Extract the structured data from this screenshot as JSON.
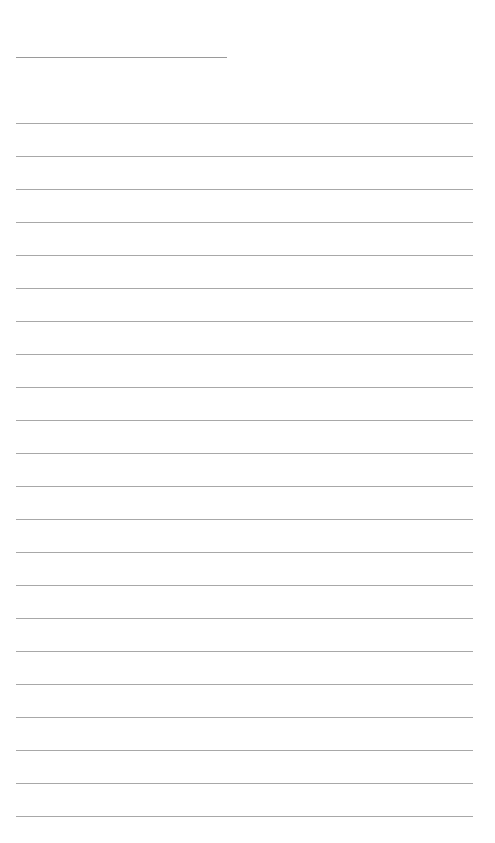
{
  "page": {
    "type": "lined-writing-paper",
    "title_line": {
      "text": ""
    },
    "ruled_lines": {
      "count": 22,
      "first_top": 123,
      "spacing": 33,
      "color": "#a8a8a8"
    },
    "lines": [
      "",
      "",
      "",
      "",
      "",
      "",
      "",
      "",
      "",
      "",
      "",
      "",
      "",
      "",
      "",
      "",
      "",
      "",
      "",
      "",
      "",
      ""
    ]
  }
}
